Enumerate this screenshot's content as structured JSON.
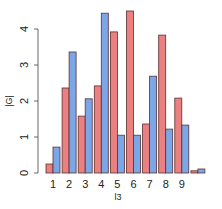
{
  "chart_data": {
    "type": "bar",
    "title": "",
    "xlabel": "l3",
    "ylabel": "|G|",
    "categories": [
      "1",
      "2",
      "3",
      "4",
      "5",
      "6",
      "7",
      "8",
      "9",
      ""
    ],
    "series": [
      {
        "name": "series-red",
        "color": "#ea8080",
        "values": [
          0.25,
          2.36,
          1.58,
          2.42,
          3.92,
          4.5,
          1.36,
          3.83,
          2.08,
          0.06
        ]
      },
      {
        "name": "series-blue",
        "color": "#7ba7e8",
        "values": [
          0.72,
          3.36,
          2.06,
          4.44,
          1.05,
          1.05,
          2.69,
          1.22,
          1.33,
          0.11
        ]
      }
    ],
    "yticks": [
      0,
      1,
      2,
      3,
      4
    ],
    "ylim": [
      0,
      4.6
    ],
    "grid": false,
    "legend": "none"
  },
  "colors": {
    "bar_border": "#5a3030",
    "axis": "#444444"
  }
}
